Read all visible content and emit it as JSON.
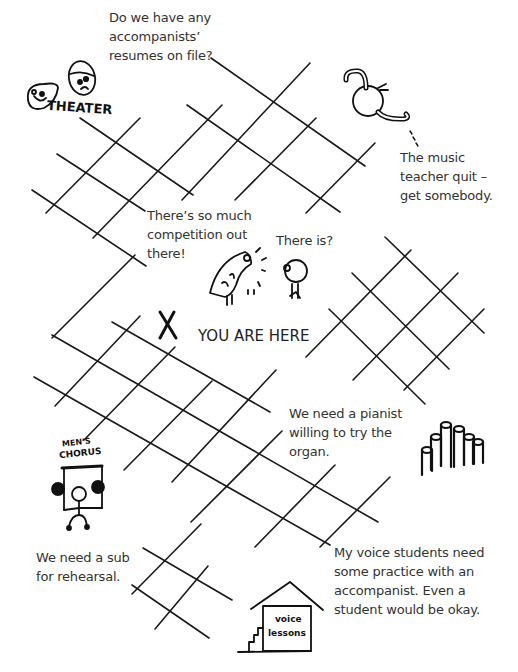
{
  "map": {
    "marker": {
      "symbol": "X",
      "label": "YOU ARE HERE"
    },
    "captions": {
      "theater": "Do we have any\naccompanists’\nresumes on file?",
      "music_teacher": "The music\nteacher quit –\nget somebody.",
      "competition": "There’s so much\ncompetition out\nthere!",
      "reply": "There is?",
      "organ": "We need a pianist\nwilling to try the\norgan.",
      "mens_chorus": "We need a sub\nfor rehearsal.",
      "voice_lessons": "My voice students need\nsome practice with an\naccompanist. Even a\nstudent would be okay."
    },
    "drawings": {
      "theater_sign": "THEATER",
      "chorus_sign_line1": "MEN’S",
      "chorus_sign_line2": "CHORUS",
      "house_sign_line1": "voice",
      "house_sign_line2": "lessons"
    }
  },
  "style": {
    "ink": "#1a1a1a",
    "text": "#333333",
    "background": "#ffffff"
  }
}
